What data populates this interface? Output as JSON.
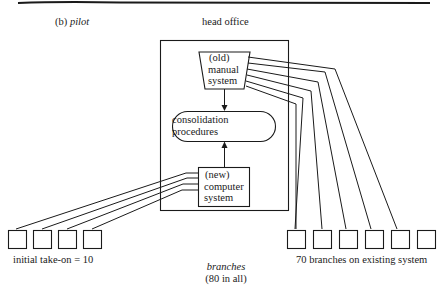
{
  "figure": {
    "section_label_prefix": "(b)",
    "section_label_title": "pilot",
    "head_office_label": "head office",
    "old_system": {
      "line1": "(old)",
      "line2": "manual",
      "line3": "system"
    },
    "consolidation": {
      "line1": "consolidation",
      "line2": "procedures"
    },
    "new_system": {
      "line1": "(new)",
      "line2": "computer",
      "line3": "system"
    },
    "left_group_label": "initial take-on = 10",
    "right_group_label": "70 branches on existing system",
    "branches_label": "branches",
    "branches_count_label": "(80 in all)",
    "left_branch_boxes_shown": 4,
    "right_branch_boxes_shown": 6,
    "colors": {
      "ink": "#1a1a1a",
      "background": "#ffffff"
    }
  }
}
